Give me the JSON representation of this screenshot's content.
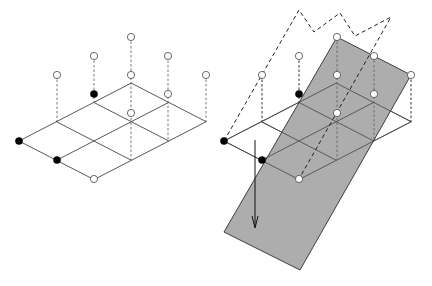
{
  "figure": {
    "colors": {
      "background": "#ffffff",
      "grid": "#444444",
      "plane_fill": "#a9a9a9",
      "filled_point": "#000000",
      "open_point": "#ffffff"
    }
  },
  "left_panel": {
    "lattice": {
      "origin": [
        19,
        141
      ],
      "u": [
        37.4,
        -19.3
      ],
      "v": [
        37.5,
        19.3
      ],
      "cols": 3,
      "rows": 2
    },
    "stems": [
      {
        "top": [
          57,
          75
        ],
        "bottom": [
          57,
          122
        ]
      },
      {
        "top": [
          94,
          56
        ],
        "bottom": [
          94,
          102
        ]
      },
      {
        "top": [
          131,
          37
        ],
        "bottom": [
          131,
          160
        ]
      },
      {
        "top": [
          168,
          56
        ],
        "bottom": [
          168,
          141
        ]
      },
      {
        "top": [
          206,
          75
        ],
        "bottom": [
          206,
          122
        ]
      }
    ],
    "open_points": [
      [
        57,
        75
      ],
      [
        94,
        56
      ],
      [
        131,
        37
      ],
      [
        131,
        75
      ],
      [
        168,
        56
      ],
      [
        206,
        75
      ],
      [
        168,
        94
      ],
      [
        131,
        113
      ],
      [
        94,
        179
      ]
    ],
    "filled_points": [
      [
        94,
        94
      ],
      [
        19,
        141
      ],
      [
        57,
        160
      ]
    ]
  },
  "right_panel": {
    "lattice": {
      "origin": [
        224,
        141
      ],
      "u": [
        37.4,
        -19.3
      ],
      "v": [
        37.5,
        19.3
      ],
      "cols": 3,
      "rows": 2
    },
    "plane_polygon": [
      [
        337,
        37
      ],
      [
        411,
        75
      ],
      [
        300,
        270
      ],
      [
        224,
        232
      ]
    ],
    "hull_polyline": [
      [
        224,
        141
      ],
      [
        299,
        10
      ],
      [
        314,
        32
      ],
      [
        340,
        13
      ],
      [
        355,
        36
      ],
      [
        391,
        17
      ],
      [
        299,
        179
      ]
    ],
    "stems": [
      {
        "top": [
          262,
          75
        ],
        "bottom": [
          262,
          122
        ]
      },
      {
        "top": [
          299,
          56
        ],
        "bottom": [
          299,
          102
        ]
      },
      {
        "top": [
          337,
          37
        ],
        "bottom": [
          337,
          160
        ]
      },
      {
        "top": [
          374,
          56
        ],
        "bottom": [
          374,
          141
        ]
      },
      {
        "top": [
          411,
          75
        ],
        "bottom": [
          411,
          122
        ]
      }
    ],
    "open_points": [
      [
        262,
        75
      ],
      [
        299,
        56
      ],
      [
        337,
        37
      ],
      [
        337,
        75
      ],
      [
        374,
        56
      ],
      [
        411,
        75
      ],
      [
        374,
        94
      ],
      [
        337,
        113
      ],
      [
        299,
        179
      ],
      [
        206,
        75
      ]
    ],
    "filled_points": [
      [
        299,
        94
      ],
      [
        224,
        141
      ],
      [
        262,
        160
      ]
    ],
    "arrow": {
      "from": [
        255,
        140
      ],
      "to": [
        255,
        228
      ]
    }
  }
}
